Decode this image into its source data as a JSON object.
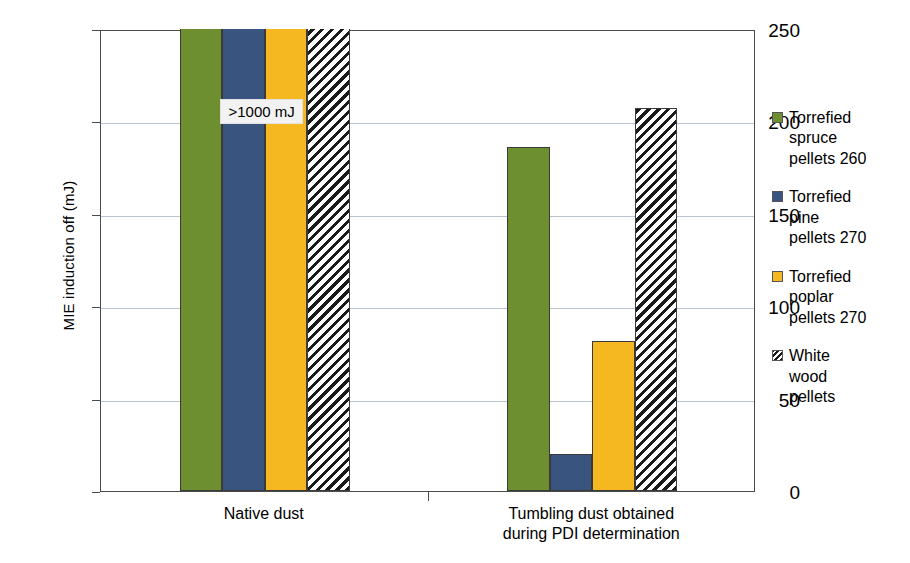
{
  "chart_data": {
    "type": "bar",
    "title": "",
    "xlabel": "",
    "ylabel": "MIE induction off (mJ)",
    "ylim": [
      0,
      250
    ],
    "yticks": [
      0,
      50,
      100,
      150,
      200,
      250
    ],
    "ytick_labels": [
      "0",
      "50",
      "100",
      "150",
      "200",
      "250"
    ],
    "grid": true,
    "legend_position": "right",
    "categories": [
      "Native dust",
      "Tumbling dust obtained\nduring PDI determination"
    ],
    "series": [
      {
        "name": "Torrefied\nspruce\npellets 260",
        "color": "#6d8f2f",
        "fill": "solid",
        "values": [
          250,
          186
        ],
        "clipped": [
          true,
          false
        ]
      },
      {
        "name": "Torrefied\npine\npellets 270",
        "color": "#3a5480",
        "fill": "solid",
        "values": [
          250,
          20
        ],
        "clipped": [
          true,
          false
        ]
      },
      {
        "name": "Torrefied\npoplar\npellets 270",
        "color": "#f5b820",
        "fill": "solid",
        "values": [
          250,
          81
        ],
        "clipped": [
          true,
          false
        ]
      },
      {
        "name": "White\nwood\npellets",
        "color": "#ffffff",
        "fill": "hatch",
        "values": [
          250,
          207
        ],
        "clipped": [
          true,
          false
        ]
      }
    ],
    "annotations": [
      {
        "text": ">1000 mJ",
        "category_index": 0,
        "value": 213
      }
    ]
  },
  "colors": {
    "axis": "#4a4a4a",
    "gridline": "#b9c4cf",
    "bar_outline": "#3a3a3a",
    "annotation_background": "#f2f2f2",
    "background": "#ffffff"
  }
}
